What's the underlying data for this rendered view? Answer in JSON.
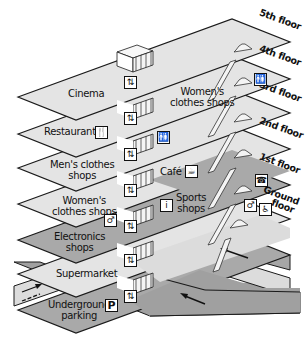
{
  "diagram": {
    "type": "isometric shopping centre cross-section",
    "colors": {
      "light_floor": "#e4e4e4",
      "dark_floor": "#a9a9a9",
      "outline": "#1a1a1a",
      "road_light": "#dcdcdc",
      "road_dark": "#a0a0a0"
    },
    "floors": [
      {
        "level": "5th floor",
        "areas": [
          "Cinema"
        ],
        "shade": "light"
      },
      {
        "level": "4th floor",
        "areas": [
          "Women's clothes shops"
        ],
        "icons": [
          "toilets-icon"
        ],
        "shade": "light"
      },
      {
        "level": "3rd floor",
        "areas": [
          "Restaurants"
        ],
        "icons": [
          "restaurant-icon"
        ],
        "shade": "light"
      },
      {
        "level": "2nd floor",
        "areas": [
          "Men's clothes shops",
          "Café"
        ],
        "icons": [
          "toilets-icon",
          "cafe-icon"
        ],
        "shade": "light"
      },
      {
        "level": "1st floor",
        "areas": [
          "Women's clothes shops",
          "Sports shops"
        ],
        "icons": [
          "information-icon",
          "telephone-icon"
        ],
        "shade": "mixed"
      },
      {
        "level": "Ground floor",
        "areas": [
          "Electronics shops",
          "Supermarket"
        ],
        "icons": [
          "toilet-icon",
          "disabled-access-icon"
        ],
        "shade": "mixed"
      },
      {
        "level": "Underground",
        "areas": [
          "Underground parking"
        ],
        "icons": [
          "parking-icon"
        ],
        "shade": "dark"
      }
    ]
  },
  "labels": {
    "floor_5": "5th floor",
    "floor_4": "4th floor",
    "floor_3": "3rd floor",
    "floor_2": "2nd floor",
    "floor_1": "1st floor",
    "floor_g1": "Ground",
    "floor_g2": "floor",
    "cinema": "Cinema",
    "womens_top_1": "Women's",
    "womens_top_2": "clothes shops",
    "restaurants": "Restaurants",
    "mens_1": "Men's clothes",
    "mens_2": "shops",
    "cafe": "Café",
    "womens_1": "Women's",
    "womens_2": "clothes shops",
    "sports_1": "Sports",
    "sports_2": "shops",
    "electronics_1": "Electronics",
    "electronics_2": "shops",
    "supermarket": "Supermarket",
    "parking_1": "Underground",
    "parking_2": "parking"
  },
  "icons": {
    "toilets": "🚻",
    "restaurant": "🍴",
    "cafe": "☕",
    "info": "i",
    "phone": "☎",
    "toilet_single": "♂",
    "disabled": "♿",
    "parking": "P",
    "lift": "⇅"
  }
}
